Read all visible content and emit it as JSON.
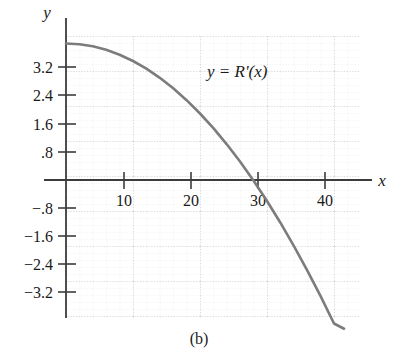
{
  "figure": {
    "caption": "(b)",
    "curve_label": "y = R'(x)",
    "x_axis_name": "x",
    "y_axis_name": "y"
  },
  "chart_data": {
    "type": "line",
    "title": "",
    "subtitle": "",
    "xlabel": "x",
    "ylabel": "y",
    "annotations": [
      "y = R'(x)"
    ],
    "caption": "(b)",
    "grid": true,
    "grid_style": "dotted",
    "legend": "none",
    "axis_color": "#4a4a4a",
    "curve_color": "#7a7a7a",
    "grid_color": "#c8c8c8",
    "xlim": [
      -2,
      44
    ],
    "ylim": [
      -4.3,
      4.1
    ],
    "x_ticks": [
      10,
      20,
      30,
      40
    ],
    "x_tick_labels": [
      "10",
      "20",
      "30",
      "40"
    ],
    "y_ticks": [
      3.2,
      2.4,
      1.6,
      0.8,
      -0.8,
      -1.6,
      -2.4,
      -3.2
    ],
    "y_tick_labels": [
      "3.2",
      "2.4",
      "1.6",
      ".8",
      "−.8",
      "−1.6",
      "−2.4",
      "−3.2"
    ],
    "x_minor_step": 2,
    "y_minor_step": 0.2,
    "series": [
      {
        "name": "y = R'(x)",
        "x": [
          0,
          2,
          4,
          6,
          8,
          10,
          12,
          14,
          16,
          18,
          20,
          22,
          24,
          26,
          28,
          30,
          32,
          34,
          35,
          36,
          38,
          40,
          41.5
        ],
        "y": [
          3.9,
          3.88,
          3.82,
          3.72,
          3.58,
          3.4,
          3.18,
          2.92,
          2.62,
          2.28,
          1.9,
          1.48,
          1.02,
          0.52,
          -0.02,
          -0.6,
          -1.22,
          -1.88,
          -2.23,
          -2.58,
          -3.32,
          -4.1,
          -4.25
        ]
      }
    ],
    "x_intercept": 35,
    "y_intercept": 3.9
  }
}
